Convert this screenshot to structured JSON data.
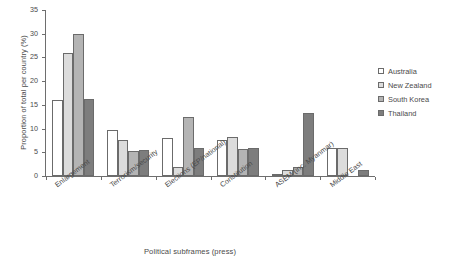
{
  "chart_data": {
    "type": "bar",
    "title": "",
    "xlabel": "Political subframes (press)",
    "ylabel": "Proportion of total per country (%)",
    "ylim": [
      0,
      35
    ],
    "yticks": [
      0,
      5,
      10,
      15,
      20,
      25,
      30,
      35
    ],
    "grid": false,
    "legend_position": "right",
    "categories": [
      "Enlargement",
      "Terrorism/security",
      "Elections (EP/national)",
      "Constitution",
      "ASEM (inc. Myanmar)",
      "Middle East"
    ],
    "series": [
      {
        "name": "Australia",
        "color": "#ffffff",
        "pattern": "solid",
        "values": [
          16.0,
          9.8,
          8.0,
          7.5,
          0.3,
          6.0
        ]
      },
      {
        "name": "New Zealand",
        "color": "#dcdcdc",
        "pattern": "light",
        "values": [
          26.0,
          7.5,
          2.0,
          8.3,
          1.2,
          6.0
        ]
      },
      {
        "name": "South Korea",
        "color": "#b0b0b0",
        "pattern": "dotted",
        "values": [
          30.0,
          5.3,
          12.4,
          5.6,
          1.8,
          0.0
        ]
      },
      {
        "name": "Thailand",
        "color": "#787878",
        "pattern": "dark",
        "values": [
          16.3,
          5.5,
          6.0,
          6.0,
          13.2,
          1.3
        ]
      }
    ]
  },
  "axes": {
    "tick_labels": [
      "0",
      "5",
      "10",
      "15",
      "20",
      "25",
      "30",
      "35"
    ]
  }
}
